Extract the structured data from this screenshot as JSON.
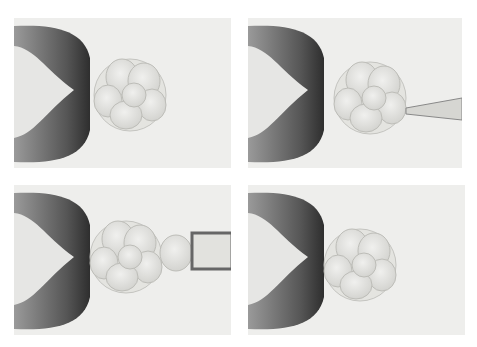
{
  "figure": {
    "panels": [
      {
        "id": "panel-1",
        "label": "embryo held by holding pipette"
      },
      {
        "id": "panel-2",
        "label": "biopsy pipette approaches zona"
      },
      {
        "id": "panel-3",
        "label": "blastomere aspirated into biopsy pipette"
      },
      {
        "id": "panel-4",
        "label": "embryo after blastomere removal"
      }
    ],
    "colors": {
      "background": "#eeeeec",
      "pipette_dark": "#3a3a3a",
      "cell": "#d8d8d4"
    }
  }
}
